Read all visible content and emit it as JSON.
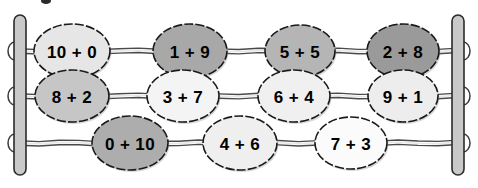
{
  "figure": {
    "name": "abacus-number-bonds-to-ten",
    "background_color": "#ffffff"
  },
  "frame": {
    "left_post_label": "left-post",
    "right_post_label": "right-post",
    "post_color": "#c9c9c9",
    "post_outline_color": "#2b2b2b",
    "rod_color": "#4a4a4a"
  },
  "palette": {
    "bead_white": "#fbfbfb",
    "bead_very_light": "#f2f2f2",
    "bead_light": "#e2e2e2",
    "bead_medium_light": "#cfcfcf",
    "bead_medium": "#bdbdbd",
    "bead_medium_dark": "#a8a8a8",
    "bead_dark": "#979797",
    "text_color": "#000000"
  },
  "rows": [
    {
      "id": "rod-1",
      "index": 1,
      "y": 51,
      "beads": [
        {
          "id": "bead-10-plus-0",
          "label": "10 + 0",
          "cx": 72,
          "rx": 38,
          "ry": 27,
          "fill": "#e6e6e6"
        },
        {
          "id": "bead-1-plus-9",
          "label": "1 + 9",
          "cx": 190,
          "rx": 37,
          "ry": 27,
          "fill": "#a8a8a8"
        },
        {
          "id": "bead-5-plus-5",
          "label": "5 + 5",
          "cx": 300,
          "rx": 35,
          "ry": 26,
          "fill": "#b5b5b5"
        },
        {
          "id": "bead-2-plus-8",
          "label": "2 + 8",
          "cx": 403,
          "rx": 36,
          "ry": 27,
          "fill": "#9a9a9a"
        }
      ]
    },
    {
      "id": "rod-2",
      "index": 2,
      "y": 96,
      "beads": [
        {
          "id": "bead-8-plus-2",
          "label": "8 + 2",
          "cx": 72,
          "rx": 37,
          "ry": 26,
          "fill": "#c6c6c6"
        },
        {
          "id": "bead-3-plus-7",
          "label": "3 + 7",
          "cx": 183,
          "rx": 36,
          "ry": 26,
          "fill": "#f4f4f4"
        },
        {
          "id": "bead-6-plus-4",
          "label": "6 + 4",
          "cx": 294,
          "rx": 36,
          "ry": 26,
          "fill": "#f0f0f0"
        },
        {
          "id": "bead-9-plus-1",
          "label": "9 + 1",
          "cx": 403,
          "rx": 35,
          "ry": 26,
          "fill": "#ededed"
        }
      ]
    },
    {
      "id": "rod-3",
      "index": 3,
      "y": 143,
      "beads": [
        {
          "id": "bead-0-plus-10",
          "label": "0 + 10",
          "cx": 130,
          "rx": 38,
          "ry": 27,
          "fill": "#adadad"
        },
        {
          "id": "bead-4-plus-6",
          "label": "4 + 6",
          "cx": 240,
          "rx": 37,
          "ry": 27,
          "fill": "#efefef"
        },
        {
          "id": "bead-7-plus-3",
          "label": "7 + 3",
          "cx": 351,
          "rx": 36,
          "ry": 26,
          "fill": "#fbfbfb"
        }
      ]
    }
  ],
  "artifact": {
    "id": "ink-speck",
    "x": 46,
    "y": 0,
    "rx": 5,
    "ry": 3
  }
}
